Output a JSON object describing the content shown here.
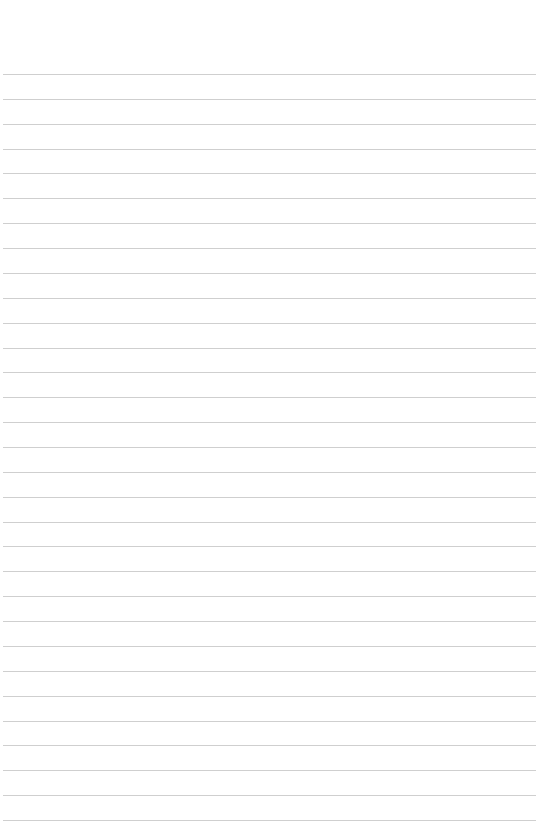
{
  "page": {
    "type": "lined-paper",
    "background_color": "#ffffff",
    "rule_color": "#cfcfcf",
    "rule_count": 31,
    "first_rule_y": 74,
    "last_rule_y": 820,
    "rule_left": 3,
    "rule_right": 536,
    "text": ""
  }
}
